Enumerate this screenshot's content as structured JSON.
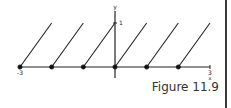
{
  "figure": {
    "caption": "Figure 11.9"
  },
  "chart_data": {
    "type": "line",
    "title": "",
    "xlabel": "x",
    "ylabel": "y",
    "xlim": [
      -3,
      3
    ],
    "ylim": [
      0,
      1
    ],
    "x_tick_labels": [
      "-3",
      "3"
    ],
    "y_tick_labels": [
      "1"
    ],
    "grid": false,
    "series": [
      {
        "name": "segment_1",
        "x": [
          -3,
          -2
        ],
        "y": [
          0,
          1
        ],
        "closed_start": true
      },
      {
        "name": "segment_2",
        "x": [
          -2,
          -1
        ],
        "y": [
          0,
          1
        ],
        "closed_start": true
      },
      {
        "name": "segment_3",
        "x": [
          -1,
          0
        ],
        "y": [
          0,
          1
        ],
        "closed_start": true
      },
      {
        "name": "segment_4",
        "x": [
          0,
          1
        ],
        "y": [
          0,
          1
        ],
        "closed_start": true
      },
      {
        "name": "segment_5",
        "x": [
          1,
          2
        ],
        "y": [
          0,
          1
        ],
        "closed_start": true
      },
      {
        "name": "segment_6",
        "x": [
          2,
          3
        ],
        "y": [
          0,
          1
        ],
        "closed_start": true
      }
    ],
    "points": [
      {
        "x": -3,
        "y": 0,
        "filled": true
      },
      {
        "x": -2,
        "y": 0,
        "filled": true
      },
      {
        "x": -1,
        "y": 0,
        "filled": true
      },
      {
        "x": 0,
        "y": 0,
        "filled": true
      },
      {
        "x": 1,
        "y": 0,
        "filled": true
      },
      {
        "x": 2,
        "y": 0,
        "filled": true
      }
    ]
  }
}
